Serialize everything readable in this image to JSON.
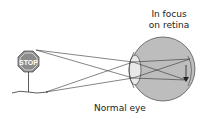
{
  "diagram": {
    "title": "Normal eye",
    "annotation_line1": "In focus",
    "annotation_line2": "on retina",
    "object": {
      "type": "stop-sign",
      "text": "STOP"
    },
    "colors": {
      "eye_fill": "#b9b9b9",
      "sign_fill": "#8c8c8c",
      "lines": "#333333"
    }
  }
}
